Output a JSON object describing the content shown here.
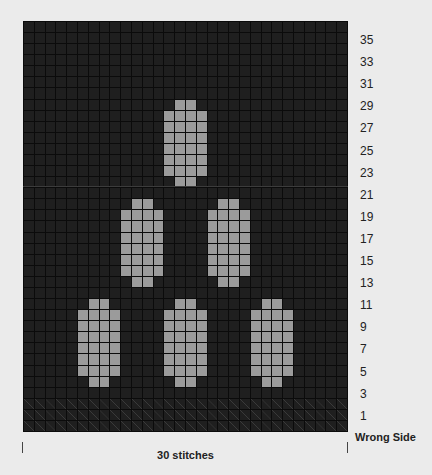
{
  "chart": {
    "stitches": 30,
    "rows": 37,
    "colors": {
      "background": "#ebebeb",
      "main_color": "#1f1f1f",
      "contrast_color": "#9b9b9b",
      "grid_line": "#0b0b0b"
    },
    "motifs": [
      {
        "name": "top-motif",
        "rows_from_top": [
          7,
          14
        ],
        "cols": [
          13,
          16
        ]
      },
      {
        "name": "middle-left-motif",
        "rows_from_top": [
          16,
          23
        ],
        "cols": [
          9,
          12
        ]
      },
      {
        "name": "middle-right-motif",
        "rows_from_top": [
          16,
          23
        ],
        "cols": [
          17,
          20
        ]
      },
      {
        "name": "bottom-left-motif",
        "rows_from_top": [
          25,
          32
        ],
        "cols": [
          5,
          8
        ]
      },
      {
        "name": "bottom-center-motif",
        "rows_from_top": [
          25,
          32
        ],
        "cols": [
          13,
          16
        ]
      },
      {
        "name": "bottom-right-motif",
        "rows_from_top": [
          25,
          32
        ],
        "cols": [
          21,
          24
        ]
      }
    ],
    "purl_rows_from_top": [
      34,
      35,
      36
    ]
  },
  "row_labels": [
    "35",
    "33",
    "31",
    "29",
    "27",
    "25",
    "23",
    "21",
    "19",
    "17",
    "15",
    "13",
    "11",
    "9",
    "7",
    "5",
    "3",
    "1"
  ],
  "side_label": "Wrong Side",
  "width_label": "30 stitches"
}
